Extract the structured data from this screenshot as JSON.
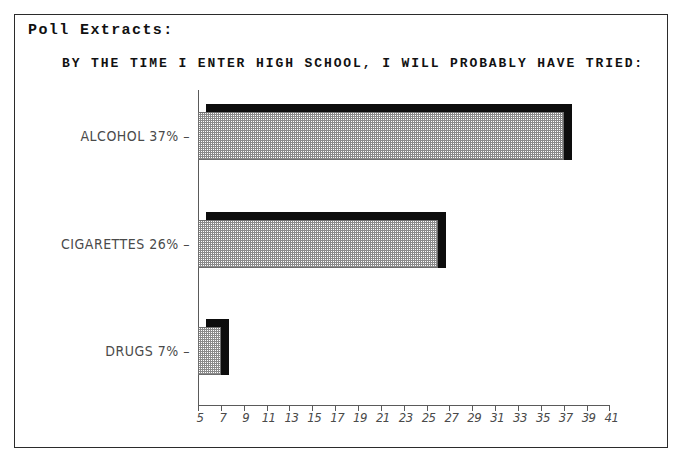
{
  "page": {
    "section_label": "Poll Extracts:"
  },
  "chart_data": {
    "type": "bar",
    "orientation": "horizontal",
    "title": "BY THE TIME I ENTER HIGH SCHOOL, I WILL PROBABLY HAVE TRIED:",
    "xlabel": "",
    "ylabel": "",
    "categories": [
      "ALCOHOL",
      "CIGARETTES",
      "DRUGS"
    ],
    "values": [
      37,
      26,
      7
    ],
    "value_suffix": "%",
    "bar_labels": [
      "ALCOHOL 37%",
      "CIGARETTES 26%",
      "DRUGS 7%"
    ],
    "xlim": [
      5,
      41
    ],
    "xticks": [
      5,
      7,
      9,
      11,
      13,
      15,
      17,
      19,
      21,
      23,
      25,
      27,
      29,
      31,
      33,
      35,
      37,
      39,
      41
    ],
    "xtick_labels": [
      "5",
      "7",
      "9",
      "11",
      "13",
      "15",
      "17",
      "19",
      "21",
      "23",
      "25",
      "27",
      "29",
      "31",
      "33",
      "35",
      "37",
      "39",
      "41"
    ],
    "grid": false,
    "legend": false,
    "style": {
      "bar_fill": "#8a8a8a",
      "bar_fill_pattern": "fine-checkerboard-dither",
      "bar_outline": "#6e6e6e",
      "bar_shadow": "#0d0d0d",
      "axis_color": "#5a5a5a",
      "text_color": "#4a4a4a",
      "title_color": "#111111",
      "background": "#ffffff",
      "frame_color": "#2b2b2b"
    }
  }
}
